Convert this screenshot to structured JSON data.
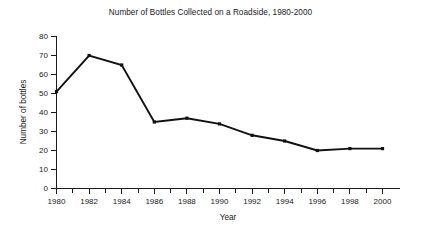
{
  "chart_data": {
    "type": "line",
    "title": "Number of Bottles Collected on a Roadside, 1980-2000",
    "xlabel": "Year",
    "ylabel": "Number of bottles",
    "x": [
      1980,
      1982,
      1984,
      1986,
      1988,
      1990,
      1992,
      1994,
      1996,
      1998,
      2000
    ],
    "values": [
      51,
      70,
      65,
      35,
      37,
      34,
      28,
      25,
      20,
      21,
      21
    ],
    "series": [
      {
        "name": "Number of bottles",
        "values": [
          51,
          70,
          65,
          35,
          37,
          34,
          28,
          25,
          20,
          21,
          21
        ]
      }
    ],
    "xlim": [
      1980,
      2000
    ],
    "ylim": [
      0,
      80
    ],
    "y_ticks": [
      0,
      10,
      20,
      30,
      40,
      50,
      60,
      70,
      80
    ],
    "y_tick_labels": [
      "0",
      "10",
      "20",
      "30",
      "40",
      "50",
      "60",
      "70",
      "80"
    ],
    "x_ticks": [
      1980,
      1982,
      1984,
      1986,
      1988,
      1990,
      1992,
      1994,
      1996,
      1998,
      2000
    ],
    "x_tick_labels": [
      "1980",
      "1982",
      "1984",
      "1986",
      "1988",
      "1990",
      "1992",
      "1994",
      "1996",
      "1998",
      "2000"
    ],
    "x_minor_ticks": [
      1981,
      1983,
      1985,
      1987,
      1989,
      1991,
      1993,
      1995,
      1997,
      1999
    ],
    "grid": false,
    "legend": false,
    "marker": "square",
    "line_color": "#111111",
    "background_color": "#ffffff"
  }
}
